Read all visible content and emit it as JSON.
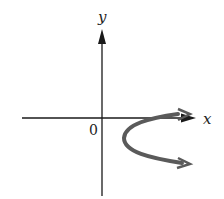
{
  "diagram": {
    "x_axis_label": "x",
    "y_axis_label": "y",
    "origin_label": "0",
    "curve": {
      "description": "parabola-like curve opening right, lying right of origin, starting near x-axis and heading right with arrows at both ends",
      "color": "#555555"
    },
    "axis_color": "#1a1a1a"
  }
}
